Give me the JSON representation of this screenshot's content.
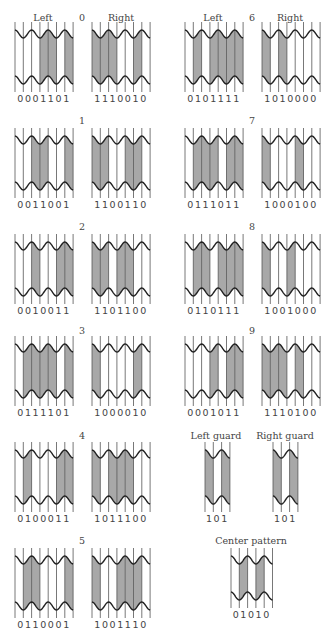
{
  "headers": {
    "left_col_left": "Left",
    "left_col_right": "Right",
    "right_col_left": "Left",
    "right_col_right": "Right"
  },
  "colors": {
    "bar_fill": "#a8a8a8",
    "line": "#222222",
    "background": "#ffffff"
  },
  "digits": [
    {
      "digit": "0",
      "left": "0001101",
      "right": "1110010"
    },
    {
      "digit": "1",
      "left": "0011001",
      "right": "1100110"
    },
    {
      "digit": "2",
      "left": "0010011",
      "right": "1101100"
    },
    {
      "digit": "3",
      "left": "0111101",
      "right": "1000010"
    },
    {
      "digit": "4",
      "left": "0100011",
      "right": "1011100"
    },
    {
      "digit": "5",
      "left": "0110001",
      "right": "1001110"
    },
    {
      "digit": "6",
      "left": "0101111",
      "right": "1010000"
    },
    {
      "digit": "7",
      "left": "0111011",
      "right": "1000100"
    },
    {
      "digit": "8",
      "left": "0110111",
      "right": "1001000"
    },
    {
      "digit": "9",
      "left": "0001011",
      "right": "1110100"
    }
  ],
  "guards": {
    "left_label": "Left guard",
    "left_bits": "101",
    "right_label": "Right guard",
    "right_bits": "101"
  },
  "center": {
    "label": "Center pattern",
    "bits": "01010"
  }
}
